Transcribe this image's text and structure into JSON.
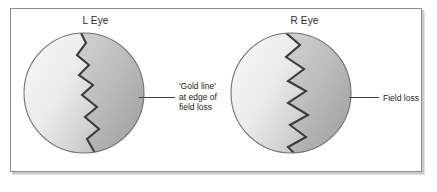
{
  "figure": {
    "title": "",
    "panels": [
      {
        "id": "left-eye",
        "label": "L Eye",
        "callout": "'Gold line'\nat edge of\nfield loss",
        "callout_lines": [
          "'Gold line'",
          "at edge of",
          "field loss"
        ],
        "shading": {
          "spared_region": "left / nasal side (light)",
          "field_loss_region": "right side (dark grey)",
          "boundary": "jagged zigzag gold line"
        }
      },
      {
        "id": "right-eye",
        "label": "R Eye",
        "callout": "Field loss",
        "callout_lines": [
          "Field loss"
        ],
        "shading": {
          "spared_region": "left side (light)",
          "field_loss_region": "right side (dark grey)",
          "boundary": "jagged zigzag gold line"
        }
      }
    ]
  },
  "colors": {
    "panel_border": "#8d8d8d",
    "panel_background": "#ffffff",
    "circle_outline": "#6f6f6f",
    "gradient_light": "#f2f2f2",
    "gradient_mid": "#d8d8d8",
    "gradient_dark": "#a9a9a9",
    "field_loss_fill": "#a8a8a8",
    "zigzag_line": "#3b3b3b",
    "leader_line": "#404040",
    "text": "#232323"
  },
  "geometry": {
    "image_width": 437,
    "image_height": 192,
    "circle_diameter": 122,
    "left_circle_center": [
      79,
      96
    ],
    "right_circle_center": [
      277,
      96
    ]
  }
}
